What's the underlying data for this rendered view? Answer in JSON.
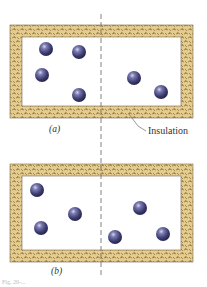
{
  "figure": {
    "panels": [
      {
        "label": "(a)",
        "box": {
          "x": 10,
          "y": 25,
          "w": 183,
          "h": 93,
          "wall": 12
        },
        "particles": [
          {
            "cx": 46,
            "cy": 49
          },
          {
            "cx": 79,
            "cy": 52
          },
          {
            "cx": 42,
            "cy": 75
          },
          {
            "cx": 79,
            "cy": 95
          },
          {
            "cx": 134,
            "cy": 78
          },
          {
            "cx": 161,
            "cy": 92
          }
        ]
      },
      {
        "label": "(b)",
        "box": {
          "x": 10,
          "y": 164,
          "w": 183,
          "h": 98,
          "wall": 12
        },
        "particles": [
          {
            "cx": 37,
            "cy": 190
          },
          {
            "cx": 75,
            "cy": 214
          },
          {
            "cx": 41,
            "cy": 228
          },
          {
            "cx": 140,
            "cy": 208
          },
          {
            "cx": 115,
            "cy": 237
          },
          {
            "cx": 163,
            "cy": 234
          }
        ]
      }
    ],
    "callout": {
      "label": "Insulation"
    },
    "caption": "Fig. 20-..."
  },
  "colors": {
    "insulation_fill": "#e3cc8e",
    "insulation_texture": "#8a6a3a",
    "particle_dark": "#2e2d5c",
    "particle_mid": "#5d5c94",
    "particle_highlight": "#c9c8e8",
    "divider": "#666666"
  }
}
